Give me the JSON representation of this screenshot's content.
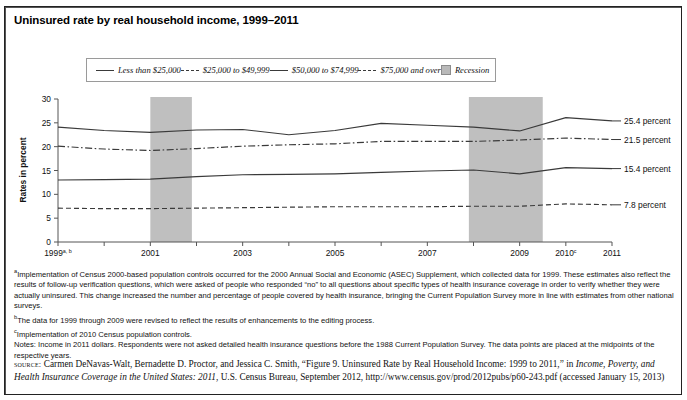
{
  "title": "Uninsured rate by real household income, 1999–2011",
  "legend": {
    "position": "top-center",
    "items": [
      {
        "label": "Less than $25,000",
        "style": "solid",
        "icon": "line-solid-icon"
      },
      {
        "label": "$25,000 to $49,999",
        "style": "dash-dot",
        "icon": "line-dashdot-icon"
      },
      {
        "label": "$50,000 to $74,999",
        "style": "solid",
        "icon": "line-solid-icon"
      },
      {
        "label": "$75,000 and over",
        "style": "dashed",
        "icon": "line-dashed-icon"
      },
      {
        "label": "Recession",
        "style": "band",
        "icon": "recession-swatch-icon"
      }
    ]
  },
  "axes": {
    "ylabel": "Rates in percent",
    "yticks": [
      "0",
      "5",
      "10",
      "15",
      "20",
      "25",
      "30"
    ],
    "ylim": [
      0,
      30
    ],
    "xticks": [
      {
        "label": "1999",
        "sup": "a, b"
      },
      {
        "label": "2000",
        "sup": ""
      },
      {
        "label": "2001",
        "sup": ""
      },
      {
        "label": "2002",
        "sup": ""
      },
      {
        "label": "2003",
        "sup": ""
      },
      {
        "label": "2004",
        "sup": ""
      },
      {
        "label": "2005",
        "sup": ""
      },
      {
        "label": "2006",
        "sup": ""
      },
      {
        "label": "2007",
        "sup": ""
      },
      {
        "label": "2008",
        "sup": ""
      },
      {
        "label": "2009",
        "sup": ""
      },
      {
        "label": "2010",
        "sup": "c"
      },
      {
        "label": "2011",
        "sup": ""
      }
    ]
  },
  "end_labels": [
    {
      "text": "25.4 percent",
      "series": "Less than $25,000"
    },
    {
      "text": "21.5 percent",
      "series": "$25,000 to $49,999"
    },
    {
      "text": "15.4 percent",
      "series": "$50,000 to $74,999"
    },
    {
      "text": "7.8 percent",
      "series": "$75,000 and over"
    }
  ],
  "notes": {
    "a": "Implementation of Census 2000-based population controls occurred for the 2000 Annual Social and Economic (ASEC) Supplement, which collected data for 1999. These estimates also reflect the results of follow-up verification questions, which were asked of people who responded “no” to all questions about specific types of health insurance coverage in order to verify whether they were actually uninsured. This change increased the number and percentage of people covered by health insurance, bringing the Current Population Survey more in line with estimates from other national surveys.",
    "b": "The data for 1999 through 2009 were revised to reflect the results of enhancements to the editing process.",
    "c": "Implementation of 2010 Census population controls.",
    "general": "Notes: Income in 2011 dollars. Respondents were not asked detailed health insurance questions before the 1988 Current Population Survey. The data points are placed at the midpoints of the respective years."
  },
  "source": {
    "prefix": "source:",
    "part1": " Carmen DeNavas-Walt, Bernadette D. Proctor, and Jessica C. Smith, “Figure 9. Uninsured Rate by Real Household Income: 1999 to 2011,” in ",
    "italic": "Income, Poverty, and Health Insurance Coverage in the United States: 2011",
    "part2": ", U.S. Census Bureau, September 2012, http://www.census.gov/prod/2012pubs/p60-243.pdf (accessed January 15, 2013)"
  },
  "colors": {
    "line": "#3a3a3a",
    "recession_band": "#bcbcbc",
    "axis": "#555555",
    "text": "#111111"
  },
  "chart_data": {
    "type": "line",
    "title": "Uninsured rate by real household income, 1999–2011",
    "xlabel": "",
    "ylabel": "Rates in percent",
    "ylim": [
      0,
      30
    ],
    "grid": false,
    "legend_position": "top-center",
    "x": [
      1999,
      2000,
      2001,
      2002,
      2003,
      2004,
      2005,
      2006,
      2007,
      2008,
      2009,
      2010,
      2011
    ],
    "series": [
      {
        "name": "Less than $25,000",
        "style": "solid",
        "end_label": "25.4 percent",
        "values": [
          24.1,
          23.4,
          23.0,
          23.5,
          23.6,
          22.5,
          23.4,
          24.9,
          24.5,
          24.1,
          23.3,
          26.1,
          25.4
        ]
      },
      {
        "name": "$25,000 to $49,999",
        "style": "dash-dot",
        "end_label": "21.5 percent",
        "values": [
          20.1,
          19.5,
          19.2,
          19.6,
          20.1,
          20.4,
          20.6,
          21.1,
          21.1,
          21.1,
          21.4,
          21.8,
          21.5
        ]
      },
      {
        "name": "$50,000 to $74,999",
        "style": "solid",
        "end_label": "15.4 percent",
        "values": [
          13.0,
          13.1,
          13.2,
          13.7,
          14.1,
          14.2,
          14.3,
          14.6,
          14.9,
          15.1,
          14.3,
          15.6,
          15.4
        ]
      },
      {
        "name": "$75,000 and over",
        "style": "dashed",
        "end_label": "7.8 percent",
        "values": [
          7.1,
          7.0,
          7.0,
          7.1,
          7.2,
          7.3,
          7.4,
          7.4,
          7.4,
          7.5,
          7.5,
          8.0,
          7.8
        ]
      }
    ],
    "annotations": [
      {
        "type": "band",
        "label": "Recession",
        "x_start": 2001.0,
        "x_end": 2001.9
      },
      {
        "type": "band",
        "label": "Recession",
        "x_start": 2007.9,
        "x_end": 2009.5
      }
    ]
  }
}
